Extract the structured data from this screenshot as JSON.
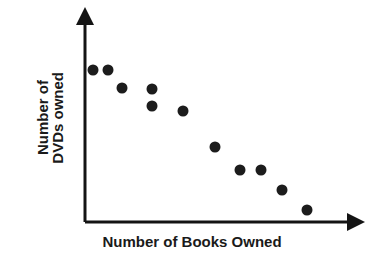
{
  "chart_data": {
    "type": "scatter",
    "title": "",
    "xlabel": "Number of Books Owned",
    "ylabel_lines": [
      "Number of",
      "DVDs owned"
    ],
    "ylabel": "Number of DVDs owned",
    "grid": false,
    "legend": null,
    "axis_ticks": false,
    "axis_style": "arrow",
    "xlim": [
      0,
      10
    ],
    "ylim": [
      0,
      10
    ],
    "marker": {
      "shape": "circle",
      "color": "#1c1c1c",
      "size_px": 11
    },
    "relationship": "negative",
    "n_points": 11,
    "points": [
      {
        "x": 0.6,
        "y": 8.4
      },
      {
        "x": 1.3,
        "y": 8.4
      },
      {
        "x": 1.9,
        "y": 7.5
      },
      {
        "x": 3.3,
        "y": 7.4
      },
      {
        "x": 3.3,
        "y": 6.6
      },
      {
        "x": 4.5,
        "y": 6.3
      },
      {
        "x": 6.0,
        "y": 4.5
      },
      {
        "x": 7.2,
        "y": 3.4
      },
      {
        "x": 8.2,
        "y": 3.4
      },
      {
        "x": 9.2,
        "y": 2.4
      },
      {
        "x": 10.4,
        "y": 1.4
      }
    ],
    "pixel_points": [
      {
        "cx": 93,
        "cy": 70
      },
      {
        "cx": 108,
        "cy": 70
      },
      {
        "cx": 122,
        "cy": 88
      },
      {
        "cx": 152,
        "cy": 89
      },
      {
        "cx": 152,
        "cy": 106
      },
      {
        "cx": 183,
        "cy": 111
      },
      {
        "cx": 215,
        "cy": 147
      },
      {
        "cx": 240,
        "cy": 170
      },
      {
        "cx": 261,
        "cy": 170
      },
      {
        "cx": 282,
        "cy": 190
      },
      {
        "cx": 307,
        "cy": 210
      }
    ],
    "axes_pixels": {
      "origin_x": 85,
      "origin_y": 222,
      "y_top": 18,
      "x_right": 356,
      "color": "#141414",
      "width_px": 3
    }
  }
}
